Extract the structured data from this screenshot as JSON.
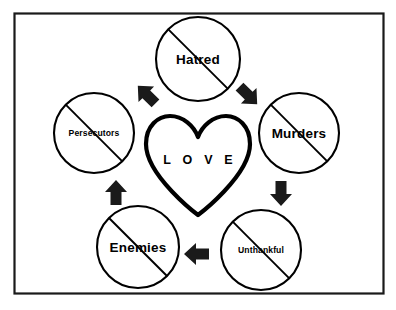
{
  "diagram": {
    "frame": {
      "border_color": "#1a1a1a",
      "background_color": "#ffffff",
      "x": 14,
      "y": 13,
      "width": 370,
      "height": 281
    },
    "center": {
      "shape": "heart-outline",
      "label": "L O V E",
      "plain_label": "LOVE",
      "color": "#000000",
      "cx": 198,
      "cy": 158
    },
    "nodes": [
      {
        "id": "hatred",
        "label": "Hatred",
        "cx": 198,
        "cy": 59,
        "r": 42,
        "crossed_out": true,
        "label_size": "large",
        "position": "top"
      },
      {
        "id": "murders",
        "label": "Murders",
        "cx": 299,
        "cy": 133,
        "r": 40,
        "crossed_out": true,
        "label_size": "large",
        "position": "right"
      },
      {
        "id": "unthankful",
        "label": "Unthankful",
        "cx": 261,
        "cy": 250,
        "r": 40,
        "crossed_out": true,
        "label_size": "small",
        "position": "bottom-right"
      },
      {
        "id": "enemies",
        "label": "Enemies",
        "cx": 138,
        "cy": 247,
        "r": 41,
        "crossed_out": true,
        "label_size": "large",
        "position": "bottom-left"
      },
      {
        "id": "persecutors",
        "label": "Persecutors",
        "cx": 94,
        "cy": 133,
        "r": 40,
        "crossed_out": true,
        "label_size": "small",
        "position": "left"
      }
    ],
    "arrows": [
      {
        "id": "arrow-persecutors-to-hatred",
        "from": "persecutors",
        "to": "hatred",
        "direction": "up-right",
        "x": 147,
        "y": 95,
        "rotation": -45
      },
      {
        "id": "arrow-hatred-to-murders",
        "from": "hatred",
        "to": "murders",
        "direction": "down-right",
        "x": 247,
        "y": 95,
        "rotation": 135
      },
      {
        "id": "arrow-murders-to-unthankful",
        "from": "murders",
        "to": "unthankful",
        "direction": "down",
        "x": 281,
        "y": 193,
        "rotation": 180
      },
      {
        "id": "arrow-unthankful-to-enemies",
        "from": "unthankful",
        "to": "enemies",
        "direction": "left",
        "x": 197,
        "y": 254,
        "rotation": -90
      },
      {
        "id": "arrow-enemies-to-persecutors",
        "from": "enemies",
        "to": "persecutors",
        "direction": "up",
        "x": 116,
        "y": 193,
        "rotation": 0
      }
    ],
    "colors": {
      "stroke": "#000000",
      "arrow_fill": "#1a1a1a",
      "background": "#ffffff",
      "frame": "#1a1a1a"
    }
  }
}
